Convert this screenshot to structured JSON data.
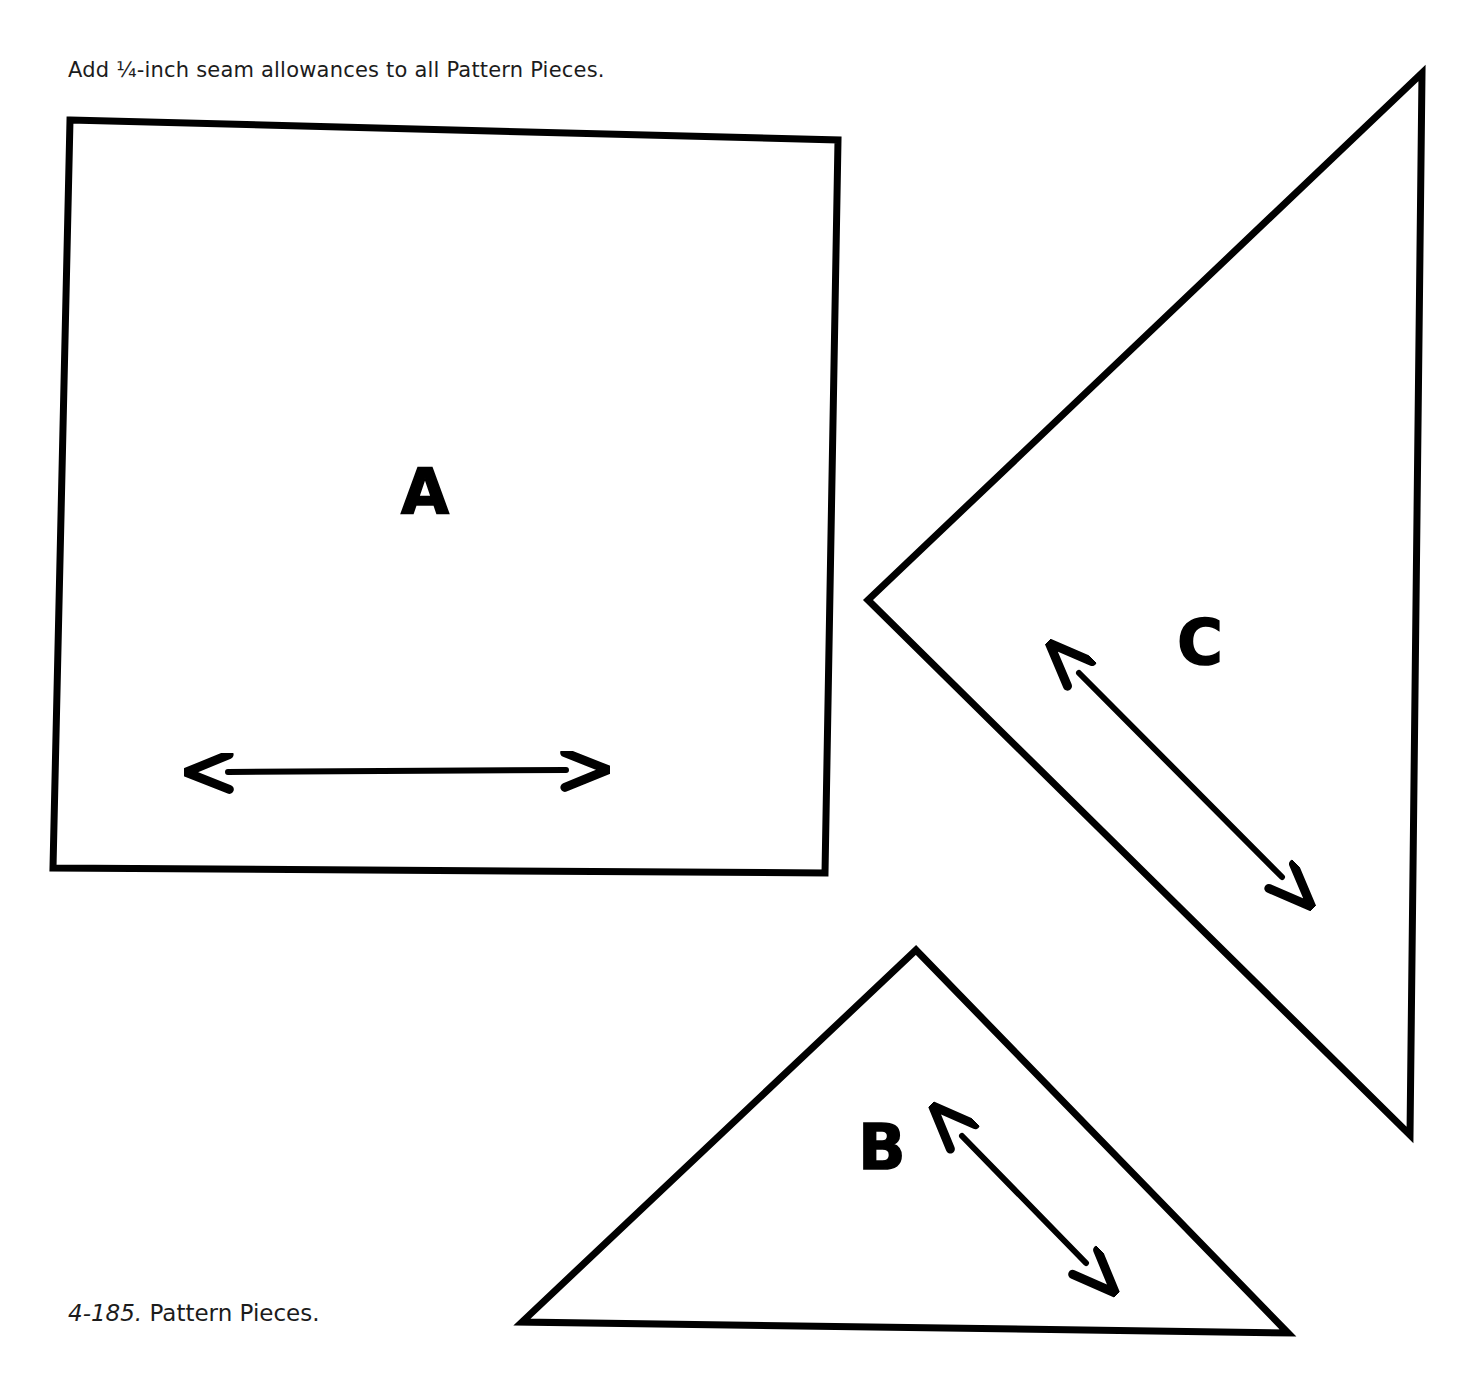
{
  "page": {
    "width": 1468,
    "height": 1378,
    "background_color": "#ffffff",
    "ink_color": "#000000"
  },
  "note": {
    "text": "Add ¼-inch seam allowances to all Pattern Pieces."
  },
  "caption": {
    "number": "4-185.",
    "title": "Pattern Pieces."
  },
  "pieces": [
    {
      "id": "A",
      "label": "A",
      "shape": "square",
      "label_x": 425,
      "label_y": 492,
      "outline_points": "70,120 838,140 825,873 53,868",
      "grain_arrow": {
        "x1": 228,
        "y1": 772,
        "x2": 566,
        "y2": 770
      }
    },
    {
      "id": "B",
      "label": "B",
      "shape": "triangle",
      "label_x": 882,
      "label_y": 1148,
      "outline_points": "916,950 1288,1333 522,1322",
      "grain_arrow": {
        "x1": 962,
        "y1": 1136,
        "x2": 1086,
        "y2": 1263
      }
    },
    {
      "id": "C",
      "label": "C",
      "shape": "triangle",
      "label_x": 1200,
      "label_y": 643,
      "outline_points": "1422,73 1410,1135 868,600",
      "grain_arrow": {
        "x1": 1079,
        "y1": 673,
        "x2": 1282,
        "y2": 877
      }
    }
  ]
}
